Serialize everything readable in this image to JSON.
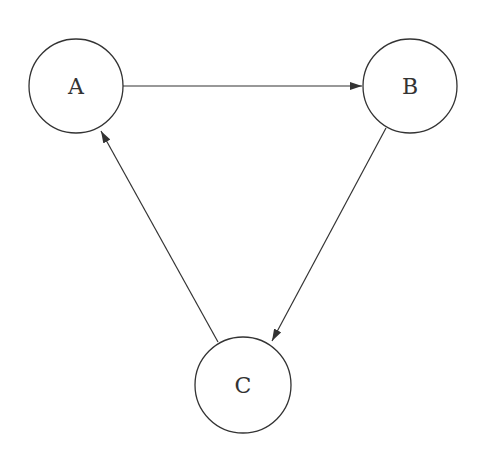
{
  "diagram": {
    "type": "directed-graph",
    "colors": {
      "stroke": "#333333",
      "background": "#ffffff"
    },
    "nodes": [
      {
        "id": "A",
        "label": "A",
        "cx": 76,
        "cy": 86,
        "r": 47
      },
      {
        "id": "B",
        "label": "B",
        "cx": 410,
        "cy": 86,
        "r": 47
      },
      {
        "id": "C",
        "label": "C",
        "cx": 243,
        "cy": 385,
        "r": 48
      }
    ],
    "edges": [
      {
        "from": "A",
        "to": "B",
        "x1": 123,
        "y1": 86,
        "x2": 362,
        "y2": 86
      },
      {
        "from": "B",
        "to": "C",
        "x1": 386,
        "y1": 128,
        "x2": 272,
        "y2": 341
      },
      {
        "from": "C",
        "to": "A",
        "x1": 218,
        "y1": 342,
        "x2": 101,
        "y2": 131
      }
    ]
  }
}
